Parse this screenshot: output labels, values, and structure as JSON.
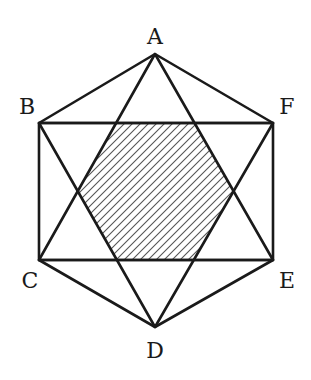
{
  "diagram": {
    "type": "geometry",
    "points": {
      "A": {
        "label": "A",
        "x": 155,
        "y": 54,
        "label_x": 155,
        "label_y": 44
      },
      "B": {
        "label": "B",
        "x": 39,
        "y": 123,
        "label_x": 27,
        "label_y": 114
      },
      "F": {
        "label": "F",
        "x": 273,
        "y": 123,
        "label_x": 287,
        "label_y": 114
      },
      "C": {
        "label": "C",
        "x": 39,
        "y": 260,
        "label_x": 30,
        "label_y": 288
      },
      "E": {
        "label": "E",
        "x": 273,
        "y": 260,
        "label_x": 287,
        "label_y": 288
      },
      "D": {
        "label": "D",
        "x": 155,
        "y": 327,
        "label_x": 155,
        "label_y": 358
      }
    },
    "outer_hexagon": [
      "A",
      "F",
      "E",
      "D",
      "C",
      "B"
    ],
    "triangles": [
      [
        "A",
        "C",
        "E"
      ],
      [
        "B",
        "D",
        "F"
      ]
    ],
    "segments": [
      [
        "B",
        "F"
      ],
      [
        "C",
        "E"
      ]
    ],
    "shaded_region": {
      "name": "inner hexagon",
      "pattern": "diagonal hatch 45deg",
      "vertices": [
        [
          116,
          123
        ],
        [
          194,
          123
        ],
        [
          233,
          192
        ],
        [
          194,
          260
        ],
        [
          116,
          260
        ],
        [
          78,
          191
        ]
      ]
    },
    "colors": {
      "stroke": "#1a1a1a",
      "hatch": "#555555",
      "background": "#ffffff"
    }
  }
}
